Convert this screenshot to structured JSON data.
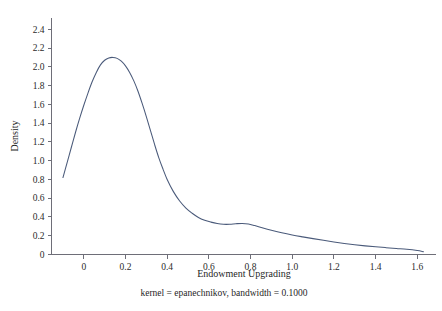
{
  "chart_data": {
    "type": "line",
    "title": "",
    "xlabel": "Endowment Upgrading",
    "ylabel": "Density",
    "subtitle": "kernel = epanechnikov, bandwidth = 0.1000",
    "grid": false,
    "legend": "none",
    "xlim": [
      -0.155,
      1.69
    ],
    "ylim": [
      0,
      2.52
    ],
    "xticks": [
      0,
      0.2,
      0.4,
      0.6,
      0.8,
      1.0,
      1.2,
      1.4,
      1.6
    ],
    "xtick_labels": [
      "0",
      "0.2",
      "0.4",
      "0.6",
      "0.8",
      "1.0",
      "1.2",
      "1.4",
      "1.6"
    ],
    "yticks": [
      0,
      0.2,
      0.4,
      0.6,
      0.8,
      1.0,
      1.2,
      1.4,
      1.6,
      1.8,
      2.0,
      2.2,
      2.4
    ],
    "ytick_labels": [
      "0",
      "0.2",
      "0.4",
      "0.6",
      "0.8",
      "1.0",
      "1.2",
      "1.4",
      "1.6",
      "1.8",
      "2.0",
      "2.2",
      "2.4"
    ],
    "series": [
      {
        "name": "Kernel density estimate",
        "color": "#4a5a7a",
        "x": [
          -0.1,
          -0.08,
          -0.06,
          -0.04,
          -0.02,
          0.0,
          0.02,
          0.04,
          0.06,
          0.08,
          0.1,
          0.12,
          0.14,
          0.16,
          0.18,
          0.2,
          0.22,
          0.24,
          0.26,
          0.28,
          0.3,
          0.32,
          0.34,
          0.36,
          0.38,
          0.4,
          0.43,
          0.46,
          0.49,
          0.52,
          0.55,
          0.58,
          0.61,
          0.64,
          0.67,
          0.7,
          0.73,
          0.76,
          0.79,
          0.82,
          0.86,
          0.9,
          0.95,
          1.0,
          1.05,
          1.1,
          1.15,
          1.2,
          1.25,
          1.3,
          1.35,
          1.4,
          1.45,
          1.5,
          1.55,
          1.6,
          1.63
        ],
        "y": [
          0.82,
          0.98,
          1.14,
          1.3,
          1.45,
          1.59,
          1.72,
          1.84,
          1.94,
          2.02,
          2.07,
          2.095,
          2.1,
          2.09,
          2.06,
          2.01,
          1.94,
          1.85,
          1.74,
          1.61,
          1.47,
          1.32,
          1.17,
          1.03,
          0.91,
          0.8,
          0.67,
          0.57,
          0.495,
          0.44,
          0.395,
          0.365,
          0.345,
          0.33,
          0.322,
          0.322,
          0.328,
          0.331,
          0.325,
          0.308,
          0.282,
          0.258,
          0.231,
          0.208,
          0.188,
          0.169,
          0.151,
          0.134,
          0.118,
          0.104,
          0.092,
          0.082,
          0.073,
          0.064,
          0.055,
          0.042,
          0.03
        ]
      }
    ],
    "annotations": {
      "peak_x": 0.14,
      "peak_y": 2.1,
      "shoulder_x": 0.75,
      "shoulder_y": 0.33
    }
  },
  "axes": {
    "x_title": "Endowment Upgrading",
    "y_title": "Density"
  },
  "footer": {
    "note": "kernel = epanechnikov, bandwidth = 0.1000"
  },
  "colors": {
    "curve": "#4a5a7a",
    "axis": "#6e6e78",
    "text": "#1f1f1f",
    "background": "#ffffff"
  }
}
